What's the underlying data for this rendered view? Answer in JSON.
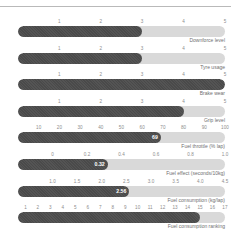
{
  "chart_data": {
    "type": "bar",
    "title": "",
    "subtitle": "",
    "xlabel": "",
    "ylabel": "",
    "orientation": "horizontal",
    "grid": false,
    "legend": null,
    "bar_color": "#4a4a4a",
    "track_color": "#d9d9d9",
    "tick_color": "#8d8d8d",
    "label_color": "#6f6f6f",
    "value_label_color": "#ffffff",
    "rows": [
      {
        "label": "Downforce level",
        "value": 3.0,
        "value_label": "",
        "axis_min": 0,
        "axis_max": 5,
        "ticks": [
          "1",
          "2",
          "3",
          "4",
          "5"
        ],
        "tick_values": [
          1,
          2,
          3,
          4,
          5
        ]
      },
      {
        "label": "Tyre usage",
        "value": 3.0,
        "value_label": "",
        "axis_min": 0,
        "axis_max": 5,
        "ticks": [
          "1",
          "2",
          "3",
          "4",
          "5"
        ],
        "tick_values": [
          1,
          2,
          3,
          4,
          5
        ]
      },
      {
        "label": "Brake wear",
        "value": 5.0,
        "value_label": "",
        "axis_min": 0,
        "axis_max": 5,
        "ticks": [
          "1",
          "2",
          "3",
          "4",
          "5"
        ],
        "tick_values": [
          1,
          2,
          3,
          4,
          5
        ]
      },
      {
        "label": "Grip level",
        "value": 4.0,
        "value_label": "",
        "axis_min": 0,
        "axis_max": 5,
        "ticks": [
          "1",
          "2",
          "3",
          "4",
          "5"
        ],
        "tick_values": [
          1,
          2,
          3,
          4,
          5
        ]
      },
      {
        "label": "Fuel throttle (% lap)",
        "value": 69,
        "value_label": "69",
        "axis_min": 0,
        "axis_max": 100,
        "ticks": [
          "10",
          "20",
          "30",
          "40",
          "50",
          "60",
          "70",
          "80",
          "90",
          "100"
        ],
        "tick_values": [
          10,
          20,
          30,
          40,
          50,
          60,
          70,
          80,
          90,
          100
        ]
      },
      {
        "label": "Fuel effect (seconds/10kg)",
        "value": 0.32,
        "value_label": "0.32",
        "axis_min": -0.2,
        "axis_max": 1.0,
        "ticks": [
          "0",
          "0.2",
          "0.4",
          "0.6",
          "0.8",
          "1.0"
        ],
        "tick_values": [
          0,
          0.2,
          0.4,
          0.6,
          0.8,
          1.0
        ]
      },
      {
        "label": "Fuel consumption (kg/lap)",
        "value": 2.56,
        "value_label": "2.56",
        "axis_min": 0.3,
        "axis_max": 4.5,
        "ticks": [
          "1.0",
          "1.5",
          "2.0",
          "2.5",
          "3.0",
          "3.5",
          "4.0",
          "4.5"
        ],
        "tick_values": [
          1.0,
          1.5,
          2.0,
          2.5,
          3.0,
          3.5,
          4.0,
          4.5
        ]
      },
      {
        "label": "Fuel consumption ranking",
        "value": 15,
        "value_label": "",
        "axis_min": 0.4,
        "axis_max": 17,
        "ticks": [
          "1",
          "2",
          "3",
          "4",
          "5",
          "6",
          "7",
          "8",
          "9",
          "10",
          "11",
          "12",
          "13",
          "14",
          "15",
          "16",
          "17"
        ],
        "tick_values": [
          1,
          2,
          3,
          4,
          5,
          6,
          7,
          8,
          9,
          10,
          11,
          12,
          13,
          14,
          15,
          16,
          17
        ]
      }
    ]
  }
}
